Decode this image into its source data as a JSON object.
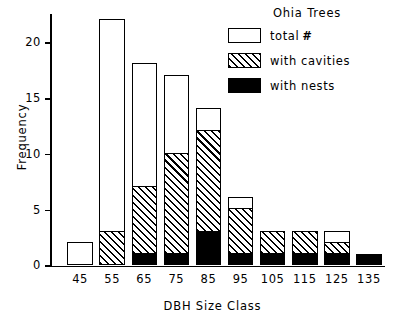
{
  "chart_data": {
    "type": "bar",
    "title": "",
    "xlabel": "DBH Size Class",
    "ylabel": "Frequency",
    "categories": [
      "45",
      "55",
      "65",
      "75",
      "85",
      "95",
      "105",
      "115",
      "125",
      "135"
    ],
    "series": [
      {
        "name": "total #",
        "values": [
          2,
          22,
          18,
          17,
          14,
          6,
          3,
          3,
          3,
          1
        ]
      },
      {
        "name": "with cavities",
        "values": [
          0,
          3,
          7,
          10,
          12,
          5,
          3,
          3,
          2,
          1
        ]
      },
      {
        "name": "with nests",
        "values": [
          0,
          0,
          1,
          1,
          3,
          1,
          1,
          1,
          1,
          1
        ]
      }
    ],
    "stacking": "overlaid-nested",
    "ylim": [
      0,
      22
    ],
    "yticks": [
      0,
      5,
      10,
      15,
      20
    ],
    "ytick_labels": [
      "0",
      "5",
      "10",
      "15",
      "20"
    ],
    "grid": false,
    "legend_position": "top-right"
  },
  "legend": {
    "title": "Ohia Trees",
    "entries": [
      {
        "label": "total",
        "symbol": "#",
        "swatch": "white-open"
      },
      {
        "label": "with cavities",
        "symbol": "",
        "swatch": "hatched"
      },
      {
        "label": "with nests",
        "symbol": "",
        "swatch": "solid-black"
      }
    ]
  },
  "colors": {
    "ink": "#000000",
    "paper": "#ffffff"
  }
}
